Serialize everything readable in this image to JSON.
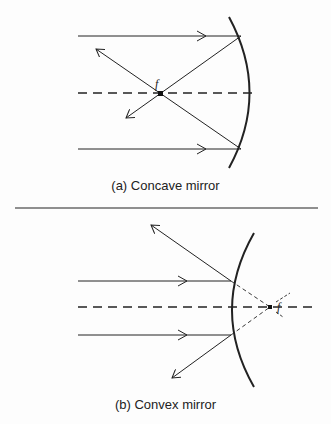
{
  "panels": [
    {
      "id": "a",
      "caption": "(a) Concave mirror",
      "mirror_type": "concave",
      "focal_label": "f"
    },
    {
      "id": "b",
      "caption": "(b) Convex mirror",
      "mirror_type": "convex",
      "focal_label": "f"
    }
  ],
  "colors": {
    "ink": "#222222",
    "background": "#fdfdfd"
  }
}
